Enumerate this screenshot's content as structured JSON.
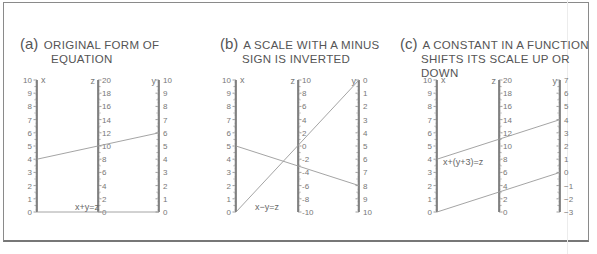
{
  "panels": [
    {
      "id": "a",
      "tag": "(a)",
      "title_line1": "ORIGINAL FORM OF",
      "title_line2": "EQUATION",
      "equation": "x+y=z",
      "axes": {
        "x": {
          "name": "x",
          "labels": [
            "10",
            "9",
            "8",
            "7",
            "6",
            "5",
            "4",
            "3",
            "2",
            "1",
            "0"
          ]
        },
        "z": {
          "name": "z",
          "labels": [
            "20",
            "18",
            "16",
            "14",
            "12",
            "10",
            "8",
            "6",
            "4",
            "2",
            "0"
          ]
        },
        "y": {
          "name": "y",
          "labels": [
            "10",
            "9",
            "8",
            "7",
            "6",
            "5",
            "4",
            "3",
            "2",
            "1",
            "0"
          ]
        }
      },
      "isopleths": [
        {
          "x": 4,
          "z": 10,
          "y": 6
        }
      ]
    },
    {
      "id": "b",
      "tag": "(b)",
      "title_line1": "A SCALE WITH A MINUS",
      "title_line2": "SIGN IS INVERTED",
      "equation": "x−y=z",
      "axes": {
        "x": {
          "name": "x",
          "labels": [
            "10",
            "9",
            "8",
            "7",
            "6",
            "5",
            "4",
            "3",
            "2",
            "1",
            "0"
          ]
        },
        "z": {
          "name": "z",
          "labels": [
            "10",
            "8",
            "6",
            "4",
            "2",
            "0",
            "-2",
            "-4",
            "-6",
            "-8",
            "-10"
          ]
        },
        "y": {
          "name": "y",
          "labels": [
            "0",
            "1",
            "2",
            "3",
            "4",
            "5",
            "6",
            "7",
            "8",
            "9",
            "10"
          ]
        }
      },
      "isopleths": [
        {
          "x": 5,
          "z": -3,
          "y": 8
        },
        {
          "x": 0,
          "z": 0,
          "y": 0
        }
      ]
    },
    {
      "id": "c",
      "tag": "(c)",
      "title_line1": "A CONSTANT IN A FUNCTION",
      "title_line2": "SHIFTS ITS SCALE UP OR DOWN",
      "equation": "x+(y+3)=z",
      "axes": {
        "x": {
          "name": "x",
          "labels": [
            "10",
            "9",
            "8",
            "7",
            "6",
            "5",
            "4",
            "3",
            "2",
            "1",
            "0"
          ]
        },
        "z": {
          "name": "z",
          "labels": [
            "20",
            "18",
            "16",
            "14",
            "12",
            "10",
            "8",
            "6",
            "4",
            "2",
            "0"
          ]
        },
        "y": {
          "name": "y",
          "labels": [
            "7",
            "6",
            "5",
            "4",
            "3",
            "2",
            "1",
            "0",
            "−1",
            "−2",
            "−3"
          ]
        }
      },
      "isopleths": [
        {
          "x": 4,
          "z": 11,
          "y": 4
        },
        {
          "x": 0,
          "z": 3,
          "y": 0
        }
      ]
    }
  ],
  "colors": {
    "frame": "#8a8a8a",
    "axis": "#6f6f6f",
    "isopleth": "#9a9a9a",
    "text": "#555555"
  }
}
